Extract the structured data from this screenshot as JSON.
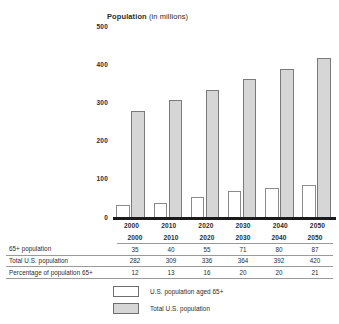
{
  "chart_data": {
    "type": "bar",
    "title": "Population (in millions)",
    "title_bold_word": "Population",
    "title_rest": " (in millions)",
    "xlabel": "",
    "ylabel": "Population (in millions)",
    "ylim": [
      0,
      500
    ],
    "yticks": [
      "500",
      "400",
      "300",
      "200",
      "100",
      "0"
    ],
    "grid": false,
    "legend_position": "bottom",
    "categories": [
      "2000",
      "2010",
      "2020",
      "2030",
      "2040",
      "2050"
    ],
    "series": [
      {
        "name": "U.S. population aged 65+",
        "color": "#ffffff",
        "values": [
          35,
          40,
          55,
          71,
          80,
          87
        ]
      },
      {
        "name": "Total U.S. population",
        "color": "#d6d6d6",
        "values": [
          282,
          309,
          336,
          364,
          392,
          420
        ]
      }
    ]
  },
  "table": {
    "header": [
      "",
      "2000",
      "2010",
      "2020",
      "2030",
      "2040",
      "2050"
    ],
    "rows": [
      {
        "label": "65+ population",
        "values": [
          "35",
          "40",
          "55",
          "71",
          "80",
          "87"
        ]
      },
      {
        "label": "Total U.S. population",
        "values": [
          "282",
          "309",
          "336",
          "364",
          "392",
          "420"
        ]
      },
      {
        "label": "Percentage of population 65+",
        "values": [
          "12",
          "13",
          "16",
          "20",
          "20",
          "21"
        ]
      }
    ]
  },
  "legend": {
    "items": [
      {
        "label": "U.S. population aged 65+",
        "swatch": "white"
      },
      {
        "label": "Total U.S. population",
        "swatch": "gray"
      }
    ]
  }
}
